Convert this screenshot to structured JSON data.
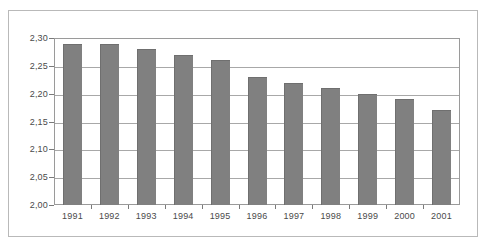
{
  "chart_data": {
    "type": "bar",
    "title": "",
    "xlabel": "",
    "ylabel": "",
    "categories": [
      "1991",
      "1992",
      "1993",
      "1994",
      "1995",
      "1996",
      "1997",
      "1998",
      "1999",
      "2000",
      "2001"
    ],
    "values": [
      2.29,
      2.29,
      2.28,
      2.27,
      2.26,
      2.23,
      2.22,
      2.21,
      2.2,
      2.19,
      2.17
    ],
    "ylim": [
      2.0,
      2.3
    ],
    "ytick_values": [
      2.0,
      2.05,
      2.1,
      2.15,
      2.2,
      2.25,
      2.3
    ],
    "ytick_labels": [
      "2,00",
      "2,05",
      "2,10",
      "2,15",
      "2,20",
      "2,25",
      "2,30"
    ],
    "grid": true,
    "legend": false,
    "legend_position": "none",
    "series": [
      {
        "name": "",
        "values": [
          2.29,
          2.29,
          2.28,
          2.27,
          2.26,
          2.23,
          2.22,
          2.21,
          2.2,
          2.19,
          2.17
        ]
      }
    ],
    "colors": {
      "bar_fill": "#808080",
      "bar_edge": "#6f6f6f",
      "gridline": "#a8a8a8",
      "axis": "#9a9a9a",
      "frame": "#b9b9b9",
      "text": "#4a4a4a",
      "background": "#ffffff"
    }
  }
}
